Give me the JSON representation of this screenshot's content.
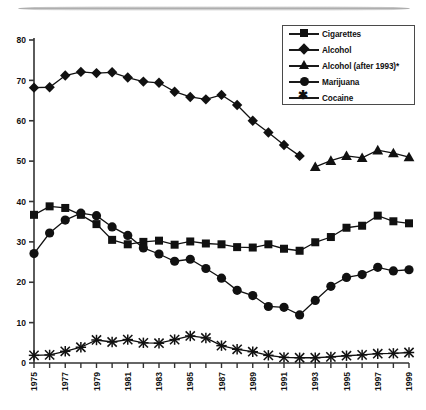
{
  "chart_data": {
    "type": "line",
    "title": "",
    "subtitle": "",
    "xlabel": "",
    "ylabel": "",
    "xlim": [
      1975,
      1999
    ],
    "ylim": [
      0,
      80
    ],
    "yticks": [
      0,
      10,
      20,
      30,
      40,
      50,
      60,
      70,
      80
    ],
    "xticks": [
      1975,
      1976,
      1977,
      1978,
      1979,
      1980,
      1981,
      1982,
      1983,
      1984,
      1985,
      1986,
      1987,
      1988,
      1989,
      1990,
      1991,
      1992,
      1993,
      1994,
      1995,
      1996,
      1997,
      1998,
      1999
    ],
    "xtick_labels": [
      "1975",
      "",
      "1977",
      "",
      "1979",
      "",
      "1981",
      "",
      "1983",
      "",
      "1985",
      "",
      "1987",
      "",
      "1989",
      "",
      "1991",
      "",
      "1993",
      "",
      "1995",
      "",
      "1997",
      "",
      "1999"
    ],
    "grid": false,
    "legend_position": "top-right",
    "series": [
      {
        "name": "Cigarettes",
        "marker": "square",
        "x": [
          1975,
          1976,
          1977,
          1978,
          1979,
          1980,
          1981,
          1982,
          1983,
          1984,
          1985,
          1986,
          1987,
          1988,
          1989,
          1990,
          1991,
          1992,
          1993,
          1994,
          1995,
          1996,
          1997,
          1998,
          1999
        ],
        "values": [
          36.7,
          38.8,
          38.4,
          36.7,
          34.4,
          30.5,
          29.4,
          30.0,
          30.3,
          29.3,
          30.1,
          29.6,
          29.4,
          28.7,
          28.6,
          29.4,
          28.3,
          27.8,
          29.9,
          31.2,
          33.5,
          34.0,
          36.5,
          35.1,
          34.6
        ]
      },
      {
        "name": "Alcohol",
        "marker": "diamond",
        "x": [
          1975,
          1976,
          1977,
          1978,
          1979,
          1980,
          1981,
          1982,
          1983,
          1984,
          1985,
          1986,
          1987,
          1988,
          1989,
          1990,
          1991,
          1992
        ],
        "values": [
          68.2,
          68.3,
          71.2,
          72.1,
          71.8,
          72.0,
          70.7,
          69.7,
          69.4,
          67.2,
          65.9,
          65.3,
          66.4,
          63.9,
          60.0,
          57.1,
          54.0,
          51.3
        ]
      },
      {
        "name": "Alcohol (after 1993)*",
        "marker": "triangle",
        "x": [
          1993,
          1994,
          1995,
          1996,
          1997,
          1998,
          1999
        ],
        "values": [
          48.6,
          50.1,
          51.3,
          50.8,
          52.7,
          52.0,
          51.0
        ]
      },
      {
        "name": "Marijuana",
        "marker": "circle",
        "x": [
          1975,
          1976,
          1977,
          1978,
          1979,
          1980,
          1981,
          1982,
          1983,
          1984,
          1985,
          1986,
          1987,
          1988,
          1989,
          1990,
          1991,
          1992,
          1993,
          1994,
          1995,
          1996,
          1997,
          1998,
          1999
        ],
        "values": [
          27.1,
          32.2,
          35.4,
          37.1,
          36.5,
          33.7,
          31.6,
          28.5,
          27.0,
          25.2,
          25.7,
          23.4,
          21.0,
          18.0,
          16.7,
          14.0,
          13.8,
          11.9,
          15.5,
          19.0,
          21.2,
          21.9,
          23.7,
          22.8,
          23.1
        ]
      },
      {
        "name": "Cocaine",
        "marker": "x",
        "x": [
          1975,
          1976,
          1977,
          1978,
          1979,
          1980,
          1981,
          1982,
          1983,
          1984,
          1985,
          1986,
          1987,
          1988,
          1989,
          1990,
          1991,
          1992,
          1993,
          1994,
          1995,
          1996,
          1997,
          1998,
          1999
        ],
        "values": [
          1.9,
          2.0,
          2.9,
          3.9,
          5.7,
          5.2,
          5.8,
          5.0,
          4.9,
          5.8,
          6.7,
          6.2,
          4.3,
          3.4,
          2.8,
          1.9,
          1.4,
          1.3,
          1.3,
          1.5,
          1.8,
          2.0,
          2.3,
          2.4,
          2.6
        ]
      }
    ]
  },
  "legend": {
    "entries": [
      {
        "label": "Cigarettes",
        "icon": "square-marker-icon"
      },
      {
        "label": "Alcohol",
        "icon": "diamond-marker-icon"
      },
      {
        "label": "Alcohol (after 1993)*",
        "icon": "triangle-marker-icon"
      },
      {
        "label": "Marijuana",
        "icon": "circle-marker-icon"
      },
      {
        "label": "Cocaine",
        "icon": "x-marker-icon"
      }
    ]
  }
}
